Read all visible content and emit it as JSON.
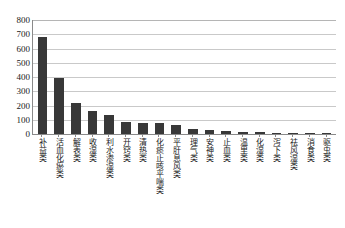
{
  "chart_data": {
    "type": "bar",
    "title": "",
    "subtitle": "",
    "xlabel": "",
    "ylabel": "",
    "ylim": [
      0,
      800
    ],
    "ytick_step": 100,
    "grid": true,
    "legend": false,
    "bar_color": "#383838",
    "gridline_color": "#c9c9c9",
    "axis_color": "#8a8a8a",
    "background_color": "#ffffff",
    "categories": [
      "补益类",
      "活血化瘀类",
      "解表类",
      "收湿类",
      "利水渗湿类",
      "开窍类",
      "清热类",
      "化痰止咳平喘类",
      "平肝息风类",
      "理气类",
      "安神类",
      "止血类",
      "温里类",
      "化湿类",
      "泻下类",
      "祛风湿类",
      "消食类",
      "驱虫类"
    ],
    "values": [
      680,
      390,
      218,
      160,
      133,
      86,
      80,
      74,
      60,
      36,
      30,
      20,
      15,
      12,
      9,
      7,
      5,
      3
    ],
    "yticks": [
      0,
      100,
      200,
      300,
      400,
      500,
      600,
      700,
      800
    ],
    "ytick_labels": [
      "0",
      "100",
      "200",
      "300",
      "400",
      "500",
      "600",
      "700",
      "800"
    ]
  }
}
